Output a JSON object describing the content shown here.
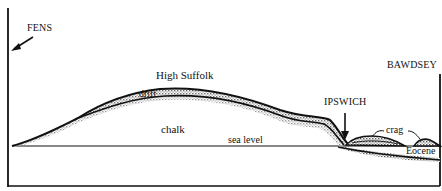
{
  "diagram": {
    "type": "geological-cross-section",
    "colors": {
      "ink": "#111111",
      "shade": "#9a9a9a",
      "background": "#ffffff"
    },
    "labels": {
      "fens": "FENS",
      "bawdsey": "BAWDSEY",
      "high_suffolk": "High Suffolk",
      "drift": "drift",
      "chalk": "chalk",
      "sea_level": "sea level",
      "ipswich": "IPSWICH",
      "crag": "crag",
      "eocene": "Eocene"
    },
    "locations": [
      "FENS",
      "High Suffolk",
      "IPSWICH",
      "BAWDSEY"
    ],
    "strata": [
      "drift",
      "chalk",
      "crag",
      "Eocene"
    ],
    "reference_line": "sea level"
  }
}
